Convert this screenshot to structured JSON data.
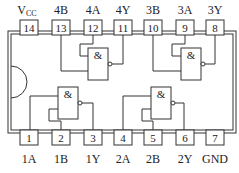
{
  "diagram": {
    "gate_symbol": "&",
    "top_pins": [
      {
        "number": "14",
        "label": "V",
        "sub": "CC"
      },
      {
        "number": "13",
        "label": "4B"
      },
      {
        "number": "12",
        "label": "4A"
      },
      {
        "number": "11",
        "label": "4Y"
      },
      {
        "number": "10",
        "label": "3B"
      },
      {
        "number": "9",
        "label": "3A"
      },
      {
        "number": "8",
        "label": "3Y"
      }
    ],
    "bottom_pins": [
      {
        "number": "1",
        "label": "1A"
      },
      {
        "number": "2",
        "label": "1B"
      },
      {
        "number": "3",
        "label": "1Y"
      },
      {
        "number": "4",
        "label": "2A"
      },
      {
        "number": "5",
        "label": "2B"
      },
      {
        "number": "6",
        "label": "2Y"
      },
      {
        "number": "7",
        "label": "GND"
      }
    ],
    "colors": {
      "line": "#333333",
      "background": "#ffffff"
    }
  }
}
